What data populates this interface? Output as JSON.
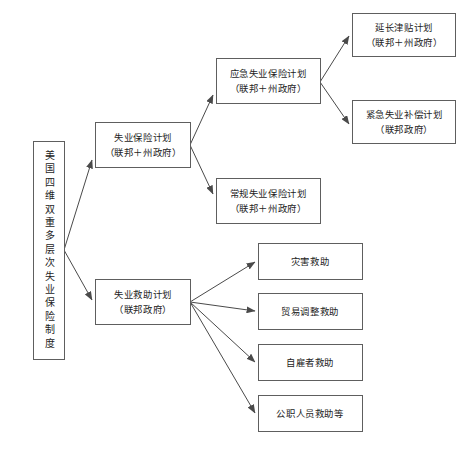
{
  "page": {
    "top_edge_artifact": "",
    "background_color": "#ffffff",
    "box_border_color": "#5e5e5e",
    "edge_color": "#4a4a4a",
    "text_color": "#1d1d1d"
  },
  "diagram": {
    "type": "tree",
    "orientation": "left-to-right",
    "root": {
      "id": "root",
      "label": "美国四维双重多层次失业保险制度",
      "text_orientation": "vertical",
      "x": 33,
      "y": 141,
      "w": 31,
      "h": 218
    },
    "nodes": [
      {
        "id": "ui-plan",
        "line1": "失业保险计划",
        "line2": "（联邦＋州政府）",
        "x": 95,
        "y": 122,
        "w": 95,
        "h": 45,
        "level": 1
      },
      {
        "id": "ua-plan",
        "line1": "失业救助计划",
        "line2": "（联邦政府）",
        "x": 95,
        "y": 279,
        "w": 95,
        "h": 45,
        "level": 1
      },
      {
        "id": "emergency-ui",
        "line1": "应急失业保险计划",
        "line2": "（联邦＋州政府）",
        "x": 216,
        "y": 58,
        "w": 104,
        "h": 45,
        "level": 2
      },
      {
        "id": "regular-ui",
        "line1": "常规失业保险计划",
        "line2": "（联邦＋州政府）",
        "x": 216,
        "y": 178,
        "w": 104,
        "h": 45,
        "level": 2
      },
      {
        "id": "extended-benefit",
        "line1": "延长津贴计划",
        "line2": "（联邦＋州政府）",
        "x": 352,
        "y": 13,
        "w": 103,
        "h": 43,
        "level": 3
      },
      {
        "id": "emergency-comp",
        "line1": "紧急失业补偿计划",
        "line2": "（联邦政府）",
        "x": 352,
        "y": 100,
        "w": 103,
        "h": 43,
        "level": 3
      },
      {
        "id": "disaster-aid",
        "line1": "灾害救助",
        "line2": "",
        "x": 258,
        "y": 243,
        "w": 104,
        "h": 36,
        "level": 2
      },
      {
        "id": "trade-adjustment-aid",
        "line1": "贸易调整救助",
        "line2": "",
        "x": 258,
        "y": 293,
        "w": 104,
        "h": 36,
        "level": 2
      },
      {
        "id": "self-employed-aid",
        "line1": "自雇者救助",
        "line2": "",
        "x": 258,
        "y": 344,
        "w": 104,
        "h": 36,
        "level": 2
      },
      {
        "id": "public-servant-aid",
        "line1": "公职人员救助等",
        "line2": "",
        "x": 258,
        "y": 395,
        "w": 104,
        "h": 36,
        "level": 2
      }
    ],
    "edges": [
      {
        "id": "root-to-ui",
        "from": "root",
        "to": "ui-plan"
      },
      {
        "id": "root-to-ua",
        "from": "root",
        "to": "ua-plan"
      },
      {
        "id": "ui-to-emergency-ui",
        "from": "ui-plan",
        "to": "emergency-ui"
      },
      {
        "id": "ui-to-regular-ui",
        "from": "ui-plan",
        "to": "regular-ui"
      },
      {
        "id": "emergency-ui-to-extended",
        "from": "emergency-ui",
        "to": "extended-benefit"
      },
      {
        "id": "emergency-ui-to-comp",
        "from": "emergency-ui",
        "to": "emergency-comp"
      },
      {
        "id": "ua-to-disaster",
        "from": "ua-plan",
        "to": "disaster-aid"
      },
      {
        "id": "ua-to-trade",
        "from": "ua-plan",
        "to": "trade-adjustment-aid"
      },
      {
        "id": "ua-to-self",
        "from": "ua-plan",
        "to": "self-employed-aid"
      },
      {
        "id": "ua-to-public",
        "from": "ua-plan",
        "to": "public-servant-aid"
      }
    ]
  }
}
